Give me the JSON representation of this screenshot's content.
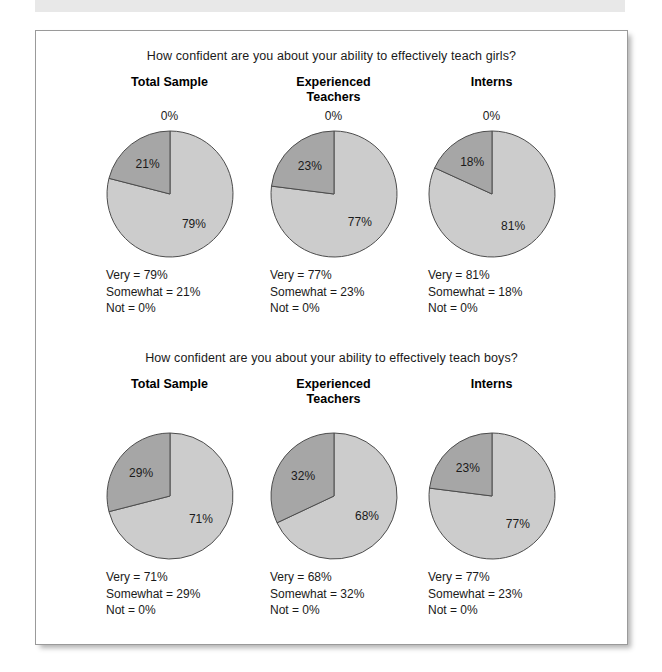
{
  "colors": {
    "very_slice": "#cccccc",
    "somewhat_slice": "#a6a6a6",
    "slice_outline": "#4d4d4d",
    "frame_border": "#9a9a9a",
    "top_band": "#e8e8e8",
    "text": "#1a1a1a"
  },
  "top_band": {
    "label": "decorative-band"
  },
  "sections": [
    {
      "title": "How confident are you about your ability to effectively teach girls?",
      "show_zero_label": true,
      "columns": [
        {
          "header": "Total Sample",
          "zero_label": "0%",
          "slices": [
            {
              "name": "Very",
              "value": 79,
              "label": "79%"
            },
            {
              "name": "Somewhat",
              "value": 21,
              "label": "21%"
            },
            {
              "name": "Not",
              "value": 0,
              "label": "0%"
            }
          ],
          "legend": [
            "Very = 79%",
            "Somewhat = 21%",
            "Not = 0%"
          ]
        },
        {
          "header": "Experienced\nTeachers",
          "zero_label": "0%",
          "slices": [
            {
              "name": "Very",
              "value": 77,
              "label": "77%"
            },
            {
              "name": "Somewhat",
              "value": 23,
              "label": "23%"
            },
            {
              "name": "Not",
              "value": 0,
              "label": "0%"
            }
          ],
          "legend": [
            "Very = 77%",
            "Somewhat = 23%",
            "Not = 0%"
          ]
        },
        {
          "header": "Interns",
          "zero_label": "0%",
          "slices": [
            {
              "name": "Very",
              "value": 81,
              "label": "81%"
            },
            {
              "name": "Somewhat",
              "value": 18,
              "label": "18%"
            },
            {
              "name": "Not",
              "value": 0,
              "label": "0%"
            }
          ],
          "legend": [
            "Very = 81%",
            "Somewhat = 18%",
            "Not = 0%"
          ]
        }
      ]
    },
    {
      "title": "How confident are you about your ability to effectively teach boys?",
      "show_zero_label": false,
      "columns": [
        {
          "header": "Total Sample",
          "zero_label": "",
          "slices": [
            {
              "name": "Very",
              "value": 71,
              "label": "71%"
            },
            {
              "name": "Somewhat",
              "value": 29,
              "label": "29%"
            },
            {
              "name": "Not",
              "value": 0,
              "label": "0%"
            }
          ],
          "legend": [
            "Very = 71%",
            "Somewhat = 29%",
            "Not = 0%"
          ]
        },
        {
          "header": "Experienced\nTeachers",
          "zero_label": "",
          "slices": [
            {
              "name": "Very",
              "value": 68,
              "label": "68%"
            },
            {
              "name": "Somewhat",
              "value": 32,
              "label": "32%"
            },
            {
              "name": "Not",
              "value": 0,
              "label": "0%"
            }
          ],
          "legend": [
            "Very = 68%",
            "Somewhat = 32%",
            "Not = 0%"
          ]
        },
        {
          "header": "Interns",
          "zero_label": "",
          "slices": [
            {
              "name": "Very",
              "value": 77,
              "label": "77%"
            },
            {
              "name": "Somewhat",
              "value": 23,
              "label": "23%"
            },
            {
              "name": "Not",
              "value": 0,
              "label": "0%"
            }
          ],
          "legend": [
            "Very = 77%",
            "Somewhat = 23%",
            "Not = 0%"
          ]
        }
      ]
    }
  ],
  "chart_data": {
    "type": "pie",
    "categories": [
      "Very",
      "Somewhat",
      "Not"
    ],
    "charts": [
      {
        "question": "How confident are you about your ability to effectively teach girls?",
        "group": "Total Sample",
        "values": [
          79,
          21,
          0
        ]
      },
      {
        "question": "How confident are you about your ability to effectively teach girls?",
        "group": "Experienced Teachers",
        "values": [
          77,
          23,
          0
        ]
      },
      {
        "question": "How confident are you about your ability to effectively teach girls?",
        "group": "Interns",
        "values": [
          81,
          18,
          0
        ]
      },
      {
        "question": "How confident are you about your ability to effectively teach boys?",
        "group": "Total Sample",
        "values": [
          71,
          29,
          0
        ]
      },
      {
        "question": "How confident are you about your ability to effectively teach boys?",
        "group": "Experienced Teachers",
        "values": [
          68,
          32,
          0
        ]
      },
      {
        "question": "How confident are you about your ability to effectively teach boys?",
        "group": "Interns",
        "values": [
          77,
          23,
          0
        ]
      }
    ],
    "legend_position": "below-chart",
    "grid": false
  }
}
